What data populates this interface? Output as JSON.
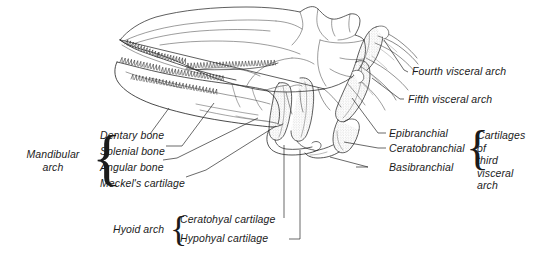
{
  "figure": {
    "type": "anatomical-line-drawing",
    "background_color": "#ffffff",
    "ink_color": "#1b1b1b"
  },
  "labels": {
    "mandibular_arch": "Mandibular\narch",
    "dentary_bone": "Dentary bone",
    "splenial_bone": "Splenial bone",
    "angular_bone": "Angular bone",
    "meckels_cartilage": "Meckel's cartilage",
    "hyoid_arch": "Hyoid arch",
    "ceratohyal_cartilage": "Ceratohyal cartilage",
    "hypohyal_cartilage": "Hypohyal cartilage",
    "fourth_visceral_arch": "Fourth visceral arch",
    "fifth_visceral_arch": "Fifth visceral arch",
    "epibranchial": "Epibranchial",
    "ceratobranchial": "Ceratobranchial",
    "basibranchial": "Basibranchial",
    "cartilages_third_visceral_arch": "Cartilages of\nthird visceral\narch"
  },
  "braces": {
    "mandibular": "{",
    "hyoid": "{",
    "third_arch": "{"
  }
}
